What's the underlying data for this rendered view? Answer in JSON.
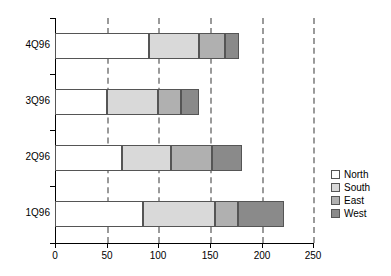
{
  "chart_data": {
    "type": "bar",
    "orientation": "horizontal",
    "stacked": true,
    "title": "",
    "xlabel": "",
    "ylabel": "",
    "categories": [
      "1Q96",
      "2Q96",
      "3Q96",
      "4Q96"
    ],
    "series": [
      {
        "name": "North",
        "color": "#ffffff",
        "values": [
          85,
          65,
          50,
          91
        ]
      },
      {
        "name": "South",
        "color": "#d9d9d9",
        "values": [
          70,
          47,
          50,
          49
        ]
      },
      {
        "name": "East",
        "color": "#b0b0b0",
        "values": [
          22,
          40,
          22,
          25
        ]
      },
      {
        "name": "West",
        "color": "#8a8a8a",
        "values": [
          45,
          29,
          18,
          13
        ]
      }
    ],
    "totals": [
      222,
      181,
      140,
      178
    ],
    "xlim": [
      0,
      250
    ],
    "xticks": [
      0,
      50,
      100,
      150,
      200,
      250
    ],
    "xtick_labels": [
      "0",
      "50",
      "100",
      "150",
      "200",
      "250"
    ],
    "grid": "vertical-dashed",
    "legend_position": "right",
    "legend_entries": [
      "North",
      "South",
      "East",
      "West"
    ]
  },
  "axis": {
    "x_tick_labels": [
      "0",
      "50",
      "100",
      "150",
      "200",
      "250"
    ],
    "y_tick_labels": [
      "4Q96",
      "3Q96",
      "2Q96",
      "1Q96"
    ]
  },
  "legend": {
    "items": [
      {
        "label": "North"
      },
      {
        "label": "South"
      },
      {
        "label": "East"
      },
      {
        "label": "West"
      }
    ]
  }
}
